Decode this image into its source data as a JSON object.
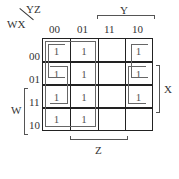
{
  "kmap": {
    "row_var": "WX",
    "col_var": "YZ",
    "col_headers": [
      "00",
      "01",
      "11",
      "10"
    ],
    "row_headers": [
      "00",
      "01",
      "11",
      "10"
    ],
    "cells": [
      [
        "1",
        "1",
        "",
        "1"
      ],
      [
        "1",
        "1",
        "",
        "1"
      ],
      [
        "1",
        "1",
        "",
        "1"
      ],
      [
        "1",
        "1",
        "",
        ""
      ]
    ],
    "brace_labels": {
      "top": "Y",
      "right": "X",
      "left": "W",
      "bottom": "Z"
    }
  },
  "colors": {
    "grid": "#222222",
    "group": "#666666",
    "text": "#333333"
  }
}
